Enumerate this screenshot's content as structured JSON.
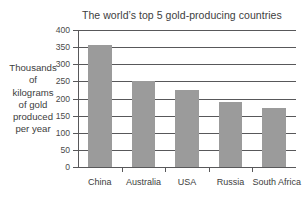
{
  "chart_data": {
    "type": "bar",
    "title": "The world’s top 5 gold-producing countries",
    "xlabel": "",
    "ylabel": "Thousands of kilograms of gold produced per year",
    "ylabel_lines": [
      "Thousands",
      "of",
      "kilograms",
      "of gold",
      "produced",
      "per year"
    ],
    "categories": [
      "China",
      "Australia",
      "USA",
      "Russia",
      "South Africa"
    ],
    "values": [
      355,
      250,
      225,
      190,
      172
    ],
    "ylim": [
      0,
      400
    ],
    "ytick_step": 50,
    "yticks": [
      0,
      50,
      100,
      150,
      200,
      250,
      300,
      350,
      400
    ],
    "ytick_labels": [
      "0",
      "50",
      "100",
      "150",
      "200",
      "250",
      "300",
      "350",
      "400"
    ],
    "grid": true,
    "legend": false,
    "bar_color": "#9b9b9b",
    "axis_color": "#58585a",
    "background": "#ffffff"
  }
}
